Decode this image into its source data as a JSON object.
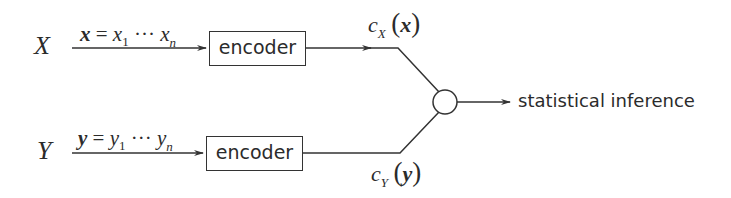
{
  "diagram": {
    "type": "block-diagram",
    "sources": [
      {
        "id": "X",
        "label": "X",
        "sequence": {
          "vector": "x",
          "first": "x",
          "first_sub": "1",
          "dots": "···",
          "last": "x",
          "last_sub": "n"
        }
      },
      {
        "id": "Y",
        "label": "Y",
        "sequence": {
          "vector": "y",
          "first": "y",
          "first_sub": "1",
          "dots": "···",
          "last": "y",
          "last_sub": "n"
        }
      }
    ],
    "encoders": [
      {
        "label": "encoder"
      },
      {
        "label": "encoder"
      }
    ],
    "codes": [
      {
        "c": "c",
        "sub": "X",
        "open": "(",
        "arg": "x",
        "close": ")"
      },
      {
        "c": "c",
        "sub": "Y",
        "open": "(",
        "arg": "y",
        "close": ")"
      }
    ],
    "combiner": {
      "shape": "circle"
    },
    "output": {
      "label": "statistical inference"
    },
    "equals": "="
  }
}
